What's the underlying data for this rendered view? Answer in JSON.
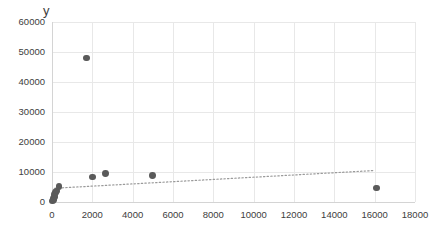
{
  "chart_data": {
    "type": "scatter",
    "title": "",
    "xlabel": "",
    "ylabel": "y",
    "xlim": [
      0,
      18000
    ],
    "ylim": [
      0,
      60000
    ],
    "xticks": [
      0,
      2000,
      4000,
      6000,
      8000,
      10000,
      12000,
      14000,
      16000,
      18000
    ],
    "yticks": [
      0,
      10000,
      20000,
      30000,
      40000,
      50000,
      60000
    ],
    "xtick_labels": [
      "0",
      "2000",
      "4000",
      "6000",
      "8000",
      "10000",
      "12000",
      "14000",
      "16000",
      "18000"
    ],
    "ytick_labels": [
      "0",
      "10000",
      "20000",
      "30000",
      "40000",
      "50000",
      "60000"
    ],
    "grid": true,
    "legend": false,
    "series": [
      {
        "name": "y",
        "marker": "circle",
        "color": "#5a5a5a",
        "points": [
          {
            "x": 40,
            "y": 300
          },
          {
            "x": 60,
            "y": 700
          },
          {
            "x": 90,
            "y": 1100
          },
          {
            "x": 110,
            "y": 1700
          },
          {
            "x": 140,
            "y": 2400
          },
          {
            "x": 170,
            "y": 3100
          },
          {
            "x": 210,
            "y": 3700
          },
          {
            "x": 350,
            "y": 5200
          },
          {
            "x": 1700,
            "y": 48000
          },
          {
            "x": 2000,
            "y": 8300
          },
          {
            "x": 2650,
            "y": 9400
          },
          {
            "x": 5000,
            "y": 8800
          },
          {
            "x": 16100,
            "y": 4700
          }
        ]
      }
    ],
    "trendline": {
      "style": "dotted",
      "color": "#9a9a9a",
      "x_start": 150,
      "y_start": 4600,
      "x_end": 16000,
      "y_end": 10500
    },
    "colors": {
      "marker": "#5a5a5a",
      "gridline": "#e8e8e8",
      "axis": "#d4d4d4",
      "text": "#404040",
      "background": "#ffffff"
    }
  }
}
